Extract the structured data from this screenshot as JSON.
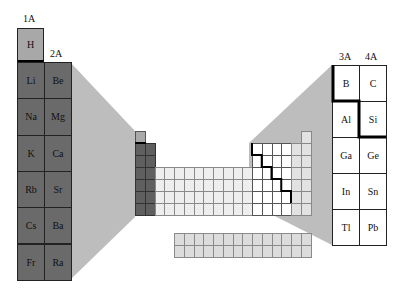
{
  "figure": {
    "type": "periodic-table-zoom-diagram",
    "colors": {
      "s_block": "#6a6a6a",
      "hydrogen": "#a8a8a8",
      "projection": "#bdbdbd",
      "d_block": "#eeeeee",
      "f_block": "#dcdcdc",
      "p_block": "#ffffff",
      "metalloid_line": "#000000"
    }
  },
  "left_panel": {
    "group_labels": [
      "1A",
      "2A"
    ],
    "hydrogen": "H",
    "rows": [
      [
        "Li",
        "Be"
      ],
      [
        "Na",
        "Mg"
      ],
      [
        "K",
        "Ca"
      ],
      [
        "Rb",
        "Sr"
      ],
      [
        "Cs",
        "Ba"
      ],
      [
        "Fr",
        "Ra"
      ]
    ]
  },
  "right_panel": {
    "group_labels": [
      "3A",
      "4A"
    ],
    "rows": [
      [
        "B",
        "C"
      ],
      [
        "Al",
        "Si"
      ],
      [
        "Ga",
        "Ge"
      ],
      [
        "In",
        "Sn"
      ],
      [
        "Tl",
        "Pb"
      ]
    ]
  }
}
